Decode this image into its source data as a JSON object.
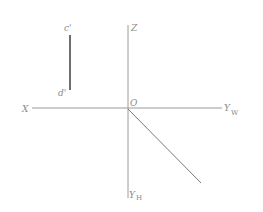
{
  "diagram": {
    "type": "orthographic-projection",
    "axes": {
      "z_label": "Z",
      "x_label": "X",
      "origin_label": "O",
      "yw_label": "Y",
      "yw_sub": "W",
      "yh_label": "Y",
      "yh_sub": "H"
    },
    "segment": {
      "top_label": "c'",
      "bottom_label": "d'",
      "color": "#6e6e6e"
    },
    "colors": {
      "axis": "#9a9a9a",
      "diagonal": "#7a7a7a",
      "label": "#8a8a8a"
    }
  }
}
